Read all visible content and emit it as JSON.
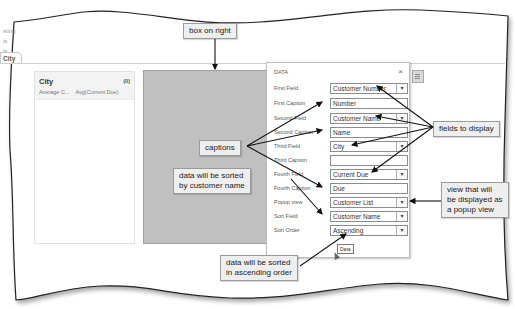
{
  "app": {
    "left_labels": [
      "sting",
      "ls",
      "ls"
    ],
    "tab": {
      "label": "City"
    }
  },
  "list_panel": {
    "title": "City",
    "count": "(0)",
    "row": {
      "col1": "Average C...",
      "col2": "Avg(Current Due)"
    }
  },
  "dialog": {
    "title": "DATA",
    "close": "×",
    "fields": [
      {
        "label": "First Field",
        "value": "Customer Number",
        "type": "dropdown"
      },
      {
        "label": "First Caption",
        "value": "Number",
        "type": "text"
      },
      {
        "label": "Second Field",
        "value": "Customer Name",
        "type": "dropdown"
      },
      {
        "label": "Second Caption",
        "value": "Name",
        "type": "text"
      },
      {
        "label": "Third Field",
        "value": "City",
        "type": "dropdown"
      },
      {
        "label": "Third Caption",
        "value": "",
        "type": "text"
      },
      {
        "label": "Fourth Field",
        "value": "Current Due",
        "type": "dropdown"
      },
      {
        "label": "Fourth Caption",
        "value": "Due",
        "type": "text"
      },
      {
        "label": "Popup view",
        "value": "Customer List",
        "type": "dropdown"
      },
      {
        "label": "Sort Field",
        "value": "Customer Name",
        "type": "dropdown"
      },
      {
        "label": "Sort Order",
        "value": "Ascending",
        "type": "dropdown"
      }
    ],
    "tooltip": "Data"
  },
  "callouts": {
    "box_on_right": "box on right",
    "captions": "captions",
    "fields_to_display": "fields to display",
    "sorted_by_name_line1": "data will be sorted",
    "sorted_by_name_line2": "by customer name",
    "popup_view_line1": "view that will",
    "popup_view_line2": "be displayed as",
    "popup_view_line3": "a popup view",
    "ascending_line1": "data will be sorted",
    "ascending_line2": "in ascending order"
  },
  "icons": {
    "chevron": "▾"
  }
}
